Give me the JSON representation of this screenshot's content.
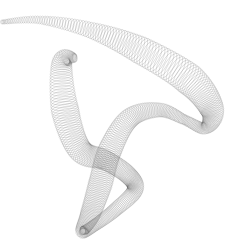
{
  "artwork": {
    "description": "Generative spirograph-style ribbon of overlapping looped gray lines forming a twisted horn shape",
    "background": "#ffffff",
    "stroke_color": "#6a6a6a",
    "loops": 420
  }
}
